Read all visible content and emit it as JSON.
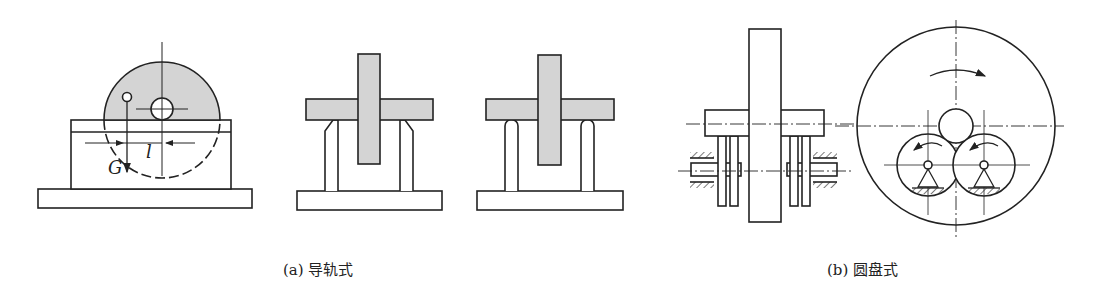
{
  "figure": {
    "captions": {
      "a": "(a) 导轨式",
      "b": "(b) 圆盘式"
    },
    "labels": {
      "weight": "G",
      "offset": "l"
    },
    "colors": {
      "stroke": "#222222",
      "fill_gray": "#d4d4d4",
      "background": "#ffffff"
    },
    "panels": [
      {
        "id": "a1",
        "description": "rotor disc on rail with offset weight G at distance l"
      },
      {
        "id": "a2",
        "description": "knife-edge rail (front view)"
      },
      {
        "id": "a3",
        "description": "rounded rail (front view)"
      },
      {
        "id": "b1",
        "description": "disc-roller balancing stand (side view)"
      },
      {
        "id": "b2",
        "description": "disc-roller balancing stand (front view) with rotation arrows"
      }
    ]
  }
}
